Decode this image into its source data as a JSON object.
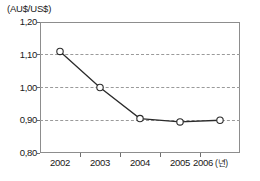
{
  "chart_data": {
    "type": "line",
    "title": "",
    "subtitle": "",
    "unit_caption": "(AU$/US$)",
    "xlabel": "",
    "xlabel_unit": "(년)",
    "ylabel": "(AU$/US$)",
    "categories": [
      "2002",
      "2003",
      "2004",
      "2005",
      "2006"
    ],
    "x": [
      2002,
      2003,
      2004,
      2005,
      2006
    ],
    "values": [
      1.11,
      1.0,
      0.905,
      0.895,
      0.9
    ],
    "series": [
      {
        "name": "AU$/US$ exchange rate",
        "values": [
          1.11,
          1.0,
          0.905,
          0.895,
          0.9
        ]
      }
    ],
    "ylim": [
      0.8,
      1.2
    ],
    "xlim": [
      2001.6,
      2006.4
    ],
    "ytick_values": [
      1.2,
      1.1,
      1.0,
      0.9,
      0.8
    ],
    "ytick_labels": [
      "1,20",
      "1,10",
      "1,00",
      "0,90",
      "0,80"
    ],
    "xtick_labels": [
      "2002",
      "2003",
      "2004",
      "2005",
      "2006"
    ],
    "gridlines": {
      "horizontal": true,
      "vertical": false,
      "style": "dashed",
      "at": [
        1.1,
        1.0,
        0.9
      ]
    },
    "legend": {
      "visible": false,
      "position": "none",
      "entries": []
    },
    "marker": "open-circle",
    "decimal_separator": ",",
    "colors": {
      "line": "#2b2b2b",
      "marker_fill": "#ffffff",
      "marker_stroke": "#2b2b2b",
      "grid": "#9a9a9a",
      "axis": "#8d8d8d",
      "text": "#191919",
      "background": "#ffffff"
    }
  }
}
